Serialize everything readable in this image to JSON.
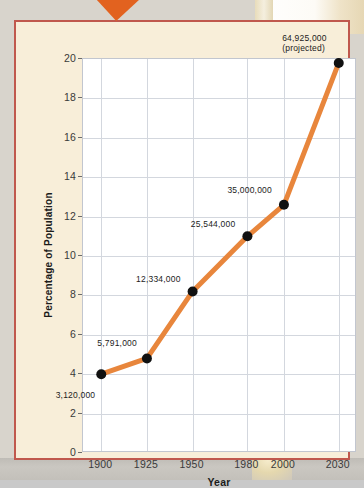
{
  "callout": {
    "label": "Essay"
  },
  "chart_data": {
    "type": "line",
    "title": "",
    "xlabel": "Year",
    "ylabel": "Percentage of Population",
    "x": [
      1900,
      1925,
      1950,
      1980,
      2000,
      2030
    ],
    "categories": [
      "1900",
      "1925",
      "1950",
      "1980",
      "2000",
      "2030"
    ],
    "values": [
      4.0,
      4.8,
      8.2,
      11.0,
      12.6,
      19.8
    ],
    "point_labels": [
      "3,120,000",
      "5,791,000",
      "12,334,000",
      "25,544,000",
      "35,000,000",
      "64,925,000\n(projected)"
    ],
    "xlim": [
      1890,
      2040
    ],
    "ylim": [
      0,
      20
    ],
    "y_ticks": [
      0,
      2,
      4,
      6,
      8,
      10,
      12,
      14,
      16,
      18,
      20
    ],
    "y_tick_labels": [
      "0",
      "2",
      "4",
      "6",
      "8",
      "10",
      "12",
      "14",
      "16",
      "18",
      "20"
    ],
    "x_ticks": [
      1900,
      1925,
      1950,
      1980,
      2000,
      2030
    ],
    "grid": true,
    "legend": "none",
    "series": [
      {
        "name": "Percentage of Population",
        "values": [
          4.0,
          4.8,
          8.2,
          11.0,
          12.6,
          19.8
        ]
      }
    ],
    "colors": {
      "line": "#e8863c",
      "marker": "#111111",
      "grid": "#d3d7de",
      "plot_background": "#ffffff",
      "frame_background": "#f8eed9",
      "frame_border": "#c0584d",
      "callout": "#e2621f"
    }
  }
}
